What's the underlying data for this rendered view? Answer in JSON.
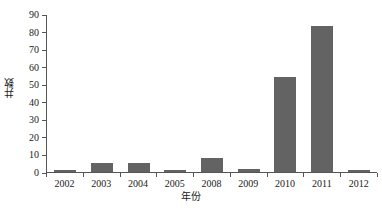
{
  "chart_data": {
    "type": "bar",
    "title": "",
    "subtitle": "",
    "xlabel": "年份",
    "ylabel": "井数",
    "categories": [
      "2002",
      "2003",
      "2004",
      "2005",
      "2008",
      "2009",
      "2010",
      "2011",
      "2012"
    ],
    "values": [
      1,
      5,
      5,
      1,
      8,
      2,
      54,
      83,
      1
    ],
    "series": [
      {
        "name": "井数",
        "values": [
          1,
          5,
          5,
          1,
          8,
          2,
          54,
          83,
          1
        ]
      }
    ],
    "ylim": [
      0,
      90
    ],
    "ytick_step": 10,
    "yticks": [
      "0",
      "10",
      "20",
      "30",
      "40",
      "50",
      "60",
      "70",
      "80",
      "90"
    ],
    "xlim_categories": 9,
    "grid": false,
    "legend": false,
    "legend_position": "none",
    "bar_color": "#636363",
    "axis_color": "#555555",
    "background_color": "#ffffff",
    "annotations": []
  }
}
